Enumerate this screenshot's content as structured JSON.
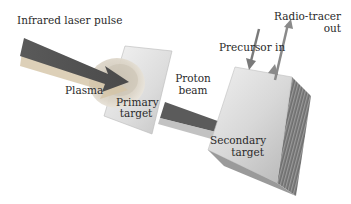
{
  "labels": {
    "laser": "Infrared laser pulse",
    "plasma": "Plasma",
    "primary_line1": "Primary",
    "primary_line2": "target",
    "proton_line1": "Proton",
    "proton_line2": "beam",
    "precursor": "Precursor in",
    "radiotracer_line1": "Radio-tracer",
    "radiotracer_line2": "out",
    "secondary_line1": "Secondary",
    "secondary_line2": "target"
  },
  "colors": {
    "arrow": "#5e5e5e",
    "arrow_shadow": "#c9b89a",
    "plate": "#e6e6e6",
    "plasma": "#d9d2c4",
    "text": "#2a2a2a"
  }
}
